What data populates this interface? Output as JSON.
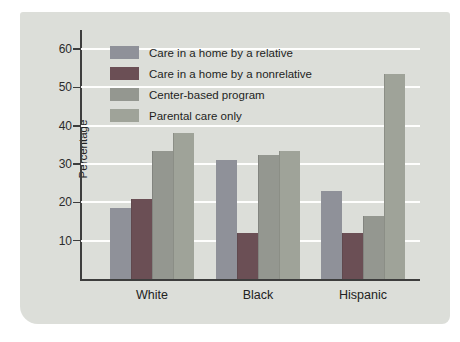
{
  "figure": {
    "panel_background": "#dcded9",
    "gridline_color": "#ffffff",
    "axis_color": "#3d3d3d"
  },
  "chart_data": {
    "type": "bar",
    "title": "",
    "xlabel": "",
    "ylabel": "Percentage",
    "categories": [
      "White",
      "Black",
      "Hispanic"
    ],
    "series": [
      {
        "name": "Care in a home by a relative",
        "color": "#8f9199",
        "values": [
          18.5,
          31,
          23
        ]
      },
      {
        "name": "Care in a home by a nonrelative",
        "color": "#6b4f55",
        "values": [
          21,
          12,
          12
        ]
      },
      {
        "name": "Center-based program",
        "color": "#949790",
        "values": [
          33.5,
          32.5,
          16.5
        ]
      },
      {
        "name": "Parental care only",
        "color": "#9fa399",
        "values": [
          38,
          33.5,
          53.5
        ]
      }
    ],
    "yticks": [
      10,
      20,
      30,
      40,
      50,
      60
    ],
    "ylim": [
      0,
      65
    ],
    "grid": true,
    "legend_position": "top-left-inside"
  }
}
